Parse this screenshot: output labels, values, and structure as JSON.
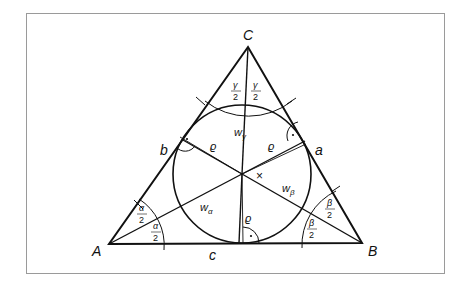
{
  "diagram": {
    "colors": {
      "stroke": "#111111",
      "frame": "#9a9a9a",
      "background": "#ffffff"
    },
    "vertices": {
      "A": {
        "label": "A",
        "x": 109,
        "y": 244
      },
      "B": {
        "label": "B",
        "x": 362,
        "y": 243
      },
      "C": {
        "label": "C",
        "x": 248,
        "y": 47
      }
    },
    "sides": {
      "a": "a",
      "b": "b",
      "c": "c"
    },
    "incenter": {
      "x": 242,
      "y": 174,
      "radius": 69
    },
    "bisectors": {
      "w_alpha": "w",
      "w_alpha_sub": "α",
      "w_beta": "w",
      "w_beta_sub": "β",
      "w_gamma": "w",
      "w_gamma_sub": "γ"
    },
    "radius_label": "ϱ",
    "half_angles": {
      "alpha_num": "α",
      "beta_num": "β",
      "gamma_num": "γ",
      "den": "2"
    },
    "centroid_mark": "×"
  }
}
